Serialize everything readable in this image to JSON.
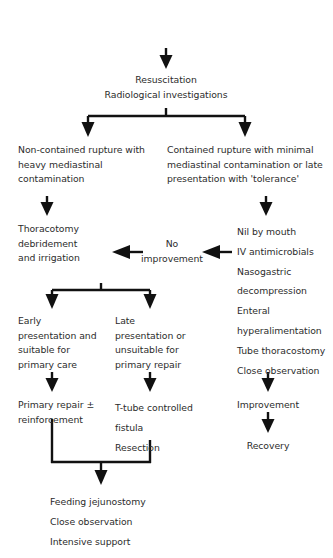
{
  "diagram": {
    "title_node": "Spontaneous rupture of the oesophagus",
    "nodes": {
      "resuscitation": "Resuscitation\nRadiological investigations",
      "non_contained": "Non-contained rupture with\nheavy mediastinal\ncontamination",
      "contained": "Contained rupture with minimal\nmediastinal contamination or late\npresentation with 'tolerance'",
      "thoracotomy": "Thoracotomy\ndebridement\nand irrigation",
      "no_improvement": "No\nimprovement",
      "conservative": "Nil by mouth\nIV antimicrobials\nNasogastric\ndecompression\nEnteral\nhyperalimentation\nTube thoracostomy\nClose observation",
      "early": "Early\npresentation and\nsuitable for\nprimary care",
      "late": "Late\npresentation or\nunsuitable for\nprimary repair",
      "primary_repair": "Primary repair ±\nreinforcement",
      "t_tube": "T-tube controlled\nfistula\nResection",
      "improvement": "Improvement",
      "recovery": "Recovery",
      "feeding": "Feeding jejunostomy\nClose observation\nIntensive support"
    },
    "colors": {
      "text": "#2c2c2c",
      "ink": "#111111",
      "background": "#ffffff"
    }
  }
}
